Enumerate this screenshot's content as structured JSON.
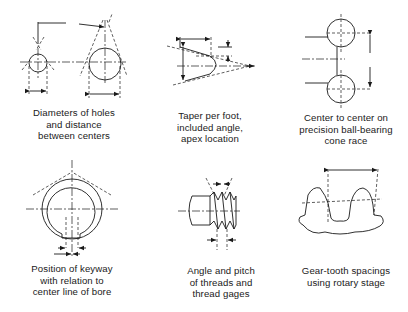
{
  "figure": {
    "panels": [
      {
        "id": "holes",
        "caption_lines": [
          "Diameters of holes",
          "and distance",
          "between centers"
        ]
      },
      {
        "id": "taper",
        "caption_lines": [
          "Taper per foot,",
          "included angle,",
          "apex location"
        ]
      },
      {
        "id": "bearing",
        "caption_lines": [
          "Center to center on",
          "precision ball-bearing",
          "cone race"
        ]
      },
      {
        "id": "keyway",
        "caption_lines": [
          "Position of keyway",
          "with relation to",
          "center line of bore"
        ]
      },
      {
        "id": "threads",
        "caption_lines": [
          "Angle and pitch",
          "of threads and",
          "thread gages"
        ]
      },
      {
        "id": "gear",
        "caption_lines": [
          "Gear-tooth spacings",
          "using rotary stage"
        ]
      }
    ]
  }
}
